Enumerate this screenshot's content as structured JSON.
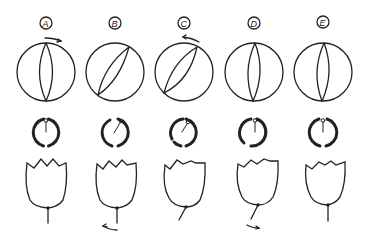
{
  "figure": {
    "panels": [
      {
        "label": "A",
        "cx": 46,
        "sphere_tilt": 0,
        "sphere_arrow": "right",
        "dial_angle": 0,
        "dial_gap": "top-bottom",
        "stem_angle": 0,
        "stem_arrow": null
      },
      {
        "label": "B",
        "cx": 115,
        "sphere_tilt": 30,
        "sphere_arrow": null,
        "dial_angle": 30,
        "dial_gap": "top-bottom",
        "stem_angle": 0,
        "stem_arrow": "left"
      },
      {
        "label": "C",
        "cx": 184,
        "sphere_tilt": 40,
        "sphere_arrow": "left",
        "dial_angle": 40,
        "dial_gap": "left",
        "stem_angle": 25,
        "stem_arrow": null
      },
      {
        "label": "D",
        "cx": 254,
        "sphere_tilt": 0,
        "sphere_arrow": null,
        "dial_angle": 0,
        "dial_gap": "bottom-left",
        "stem_angle": 25,
        "stem_arrow": "right"
      },
      {
        "label": "E",
        "cx": 323,
        "sphere_tilt": 0,
        "sphere_arrow": null,
        "dial_angle": 0,
        "dial_gap": "top-bottom",
        "stem_angle": 0,
        "stem_arrow": null
      }
    ],
    "colors": {
      "ink": "#222222",
      "background": "#ffffff"
    }
  }
}
